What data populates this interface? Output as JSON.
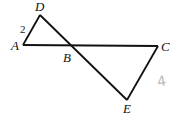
{
  "diagram": {
    "points": {
      "A": {
        "label": "A",
        "x": 23,
        "y": 45
      },
      "B": {
        "label": "B",
        "x": 71,
        "y": 46
      },
      "C": {
        "label": "C",
        "x": 158,
        "y": 46
      },
      "D": {
        "label": "D",
        "x": 40,
        "y": 15
      },
      "E": {
        "label": "E",
        "x": 127,
        "y": 100
      }
    },
    "segments": [
      "AD",
      "AC",
      "DE",
      "CE"
    ],
    "annotations": {
      "AD_length": "2",
      "handwritten": "4"
    },
    "line_color": "#111111"
  }
}
